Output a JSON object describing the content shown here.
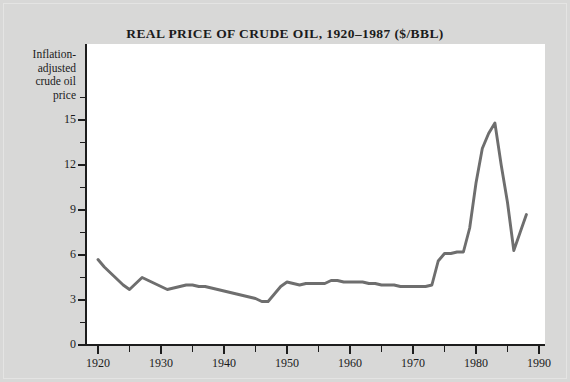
{
  "chart_data": {
    "type": "line",
    "title": "REAL PRICE OF CRUDE OIL, 1920–1987 ($/BBL)",
    "xlabel": "",
    "ylabel": "Inflation-adjusted crude oil price",
    "xlim": [
      1920,
      1990
    ],
    "ylim": [
      0,
      16.5
    ],
    "grid": false,
    "legend": null,
    "x_major_ticks": [
      1920,
      1930,
      1940,
      1950,
      1960,
      1970,
      1980,
      1990
    ],
    "x_minor_ticks": [
      1925,
      1935,
      1945,
      1955,
      1965,
      1975,
      1985
    ],
    "y_major_ticks": [
      0,
      3,
      6,
      9,
      12,
      15
    ],
    "y_minor_ticks": [
      1.5,
      4.5,
      7.5,
      10.5,
      13.5,
      16.5
    ],
    "x_tick_labels": [
      "1920",
      "1930",
      "1940",
      "1950",
      "1960",
      "1970",
      "1980",
      "1990"
    ],
    "y_tick_labels": [
      "0",
      "3",
      "6",
      "9",
      "12",
      "15"
    ],
    "series": [
      {
        "name": "Inflation-adjusted crude oil price",
        "color": "#6e6e6e",
        "x": [
          1920,
          1921,
          1922,
          1923,
          1924,
          1925,
          1926,
          1927,
          1928,
          1929,
          1930,
          1931,
          1932,
          1933,
          1934,
          1935,
          1936,
          1937,
          1938,
          1939,
          1940,
          1941,
          1942,
          1943,
          1944,
          1945,
          1946,
          1947,
          1948,
          1949,
          1950,
          1951,
          1952,
          1953,
          1954,
          1955,
          1956,
          1957,
          1958,
          1959,
          1960,
          1961,
          1962,
          1963,
          1964,
          1965,
          1966,
          1967,
          1968,
          1969,
          1970,
          1971,
          1972,
          1973,
          1974,
          1975,
          1976,
          1977,
          1978,
          1979,
          1980,
          1981,
          1982,
          1983,
          1984,
          1985,
          1986,
          1987,
          1988
        ],
        "values": [
          5.7,
          5.2,
          4.8,
          4.4,
          4.0,
          3.7,
          4.1,
          4.5,
          4.3,
          4.1,
          3.9,
          3.7,
          3.8,
          3.9,
          4.0,
          4.0,
          3.9,
          3.9,
          3.8,
          3.7,
          3.6,
          3.5,
          3.4,
          3.3,
          3.2,
          3.1,
          2.9,
          2.9,
          3.4,
          3.9,
          4.2,
          4.1,
          4.0,
          4.1,
          4.1,
          4.1,
          4.1,
          4.3,
          4.3,
          4.2,
          4.2,
          4.2,
          4.2,
          4.1,
          4.1,
          4.0,
          4.0,
          4.0,
          3.9,
          3.9,
          3.9,
          3.9,
          3.9,
          4.0,
          5.6,
          6.1,
          6.1,
          6.2,
          6.2,
          7.8,
          10.8,
          13.1,
          14.1,
          14.8,
          12.0,
          9.5,
          6.3,
          7.5,
          8.7
        ]
      }
    ]
  }
}
